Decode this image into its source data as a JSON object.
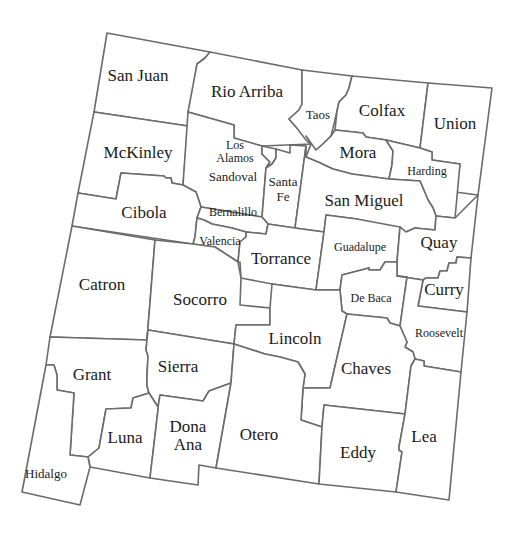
{
  "map": {
    "title": "New Mexico Counties",
    "stroke_color": "#6b6b6b",
    "fill_color": "#ffffff",
    "label_color": "#1a1a1a",
    "counties": {
      "san_juan": "San Juan",
      "rio_arriba": "Rio Arriba",
      "taos": "Taos",
      "colfax": "Colfax",
      "union": "Union",
      "mckinley": "McKinley",
      "los_alamos_1": "Los",
      "los_alamos_2": "Alamos",
      "sandoval": "Sandoval",
      "santa_fe_1": "Santa",
      "santa_fe_2": "Fe",
      "mora": "Mora",
      "harding": "Harding",
      "san_miguel": "San Miguel",
      "cibola": "Cibola",
      "bernalillo": "Bernalillo",
      "valencia": "Valencia",
      "torrance": "Torrance",
      "guadalupe": "Guadalupe",
      "quay": "Quay",
      "catron": "Catron",
      "socorro": "Socorro",
      "de_baca": "De Baca",
      "curry": "Curry",
      "roosevelt": "Roosevelt",
      "lincoln": "Lincoln",
      "grant": "Grant",
      "sierra": "Sierra",
      "chaves": "Chaves",
      "luna": "Luna",
      "dona_ana_1": "Dona",
      "dona_ana_2": "Ana",
      "otero": "Otero",
      "eddy": "Eddy",
      "lea": "Lea",
      "hidalgo": "Hidalgo"
    }
  }
}
